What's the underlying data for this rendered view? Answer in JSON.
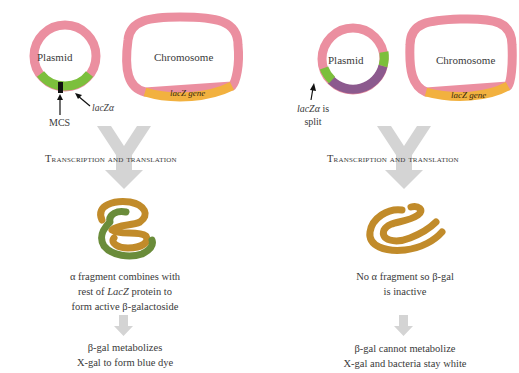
{
  "left_panel": {
    "plasmid_label": "Plasmid",
    "chromosome_label": "Chromosome",
    "gene_label": "lacZ  gene",
    "mcs_label": "MCS",
    "lacz_alpha_label": "lacZα",
    "process_label": "Transcription and translation",
    "result_line1": "α fragment combines with",
    "result_line2_pre": "rest of ",
    "result_line2_it": "LacZ",
    "result_line2_post": " protein to",
    "result_line3": "form active β-galactoside",
    "outcome_line1": "β-gal metabolizes",
    "outcome_line2": "X-gal to form blue dye"
  },
  "right_panel": {
    "plasmid_label": "Plasmid",
    "chromosome_label": "Chromosome",
    "gene_label": "lacZ  gene",
    "lacz_split_it": "lacZα",
    "lacz_split_post": " is",
    "lacz_split_line2": "split",
    "process_label": "Transcription and translation",
    "result_line1": "No α fragment so β-gal",
    "result_line2": "is inactive",
    "outcome_line1": "β-gal cannot metabolize",
    "outcome_line2": "X-gal and bacteria stay white"
  },
  "colors": {
    "ring_pink": "#eb8fa0",
    "lacz_alpha_green": "#7cbf3c",
    "mcs_black": "#111111",
    "lacz_gene_orange": "#f2b13f",
    "insert_purple": "#8c5a8e",
    "arrow_gray": "#d4d4d4",
    "protein_gold": "#c18b2a",
    "protein_green": "#6a8c3a"
  }
}
